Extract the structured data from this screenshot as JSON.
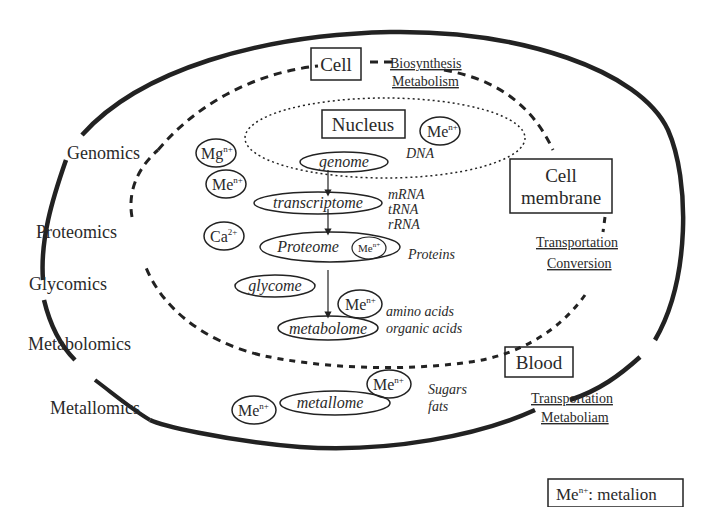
{
  "diagram": {
    "title_box": {
      "cell": "Cell"
    },
    "cell_functions": [
      "Biosynthesis",
      "Metabolism"
    ],
    "nucleus": {
      "label": "Nucleus",
      "ion": {
        "base": "Me",
        "sup": "n+"
      },
      "molecule": "DNA"
    },
    "omics_labels": [
      "Genomics",
      "Proteomics",
      "Glycomics",
      "Metabolomics",
      "Metallomics"
    ],
    "ions": {
      "mg": {
        "base": "Mg",
        "sup": "n+"
      },
      "me1": {
        "base": "Me",
        "sup": "n+"
      },
      "ca": {
        "base": "Ca",
        "sup": "2+"
      },
      "me_proteome": {
        "base": "Me",
        "sup": "n+"
      },
      "me_metabolome": {
        "base": "Me",
        "sup": "n+"
      },
      "me_metallome_left": {
        "base": "Me",
        "sup": "n+"
      },
      "me_metallome_right": {
        "base": "Me",
        "sup": "n+"
      }
    },
    "nodes": {
      "genome": "genome",
      "transcriptome": "transcriptome",
      "proteome": "Proteome",
      "glycome": "glycome",
      "metabolome": "metabolome",
      "metallome": "metallome"
    },
    "molecules": {
      "rna": [
        "mRNA",
        "tRNA",
        "rRNA"
      ],
      "proteins": "Proteins",
      "acids": [
        "amino acids",
        "organic acids"
      ],
      "sugars_fats": [
        "Sugars",
        "fats"
      ]
    },
    "cell_membrane": {
      "label_lines": [
        "Cell",
        "membrane"
      ],
      "functions": [
        "Transportation",
        "Conversion"
      ]
    },
    "blood": {
      "label": "Blood",
      "functions": [
        "Transportation",
        "Metaboliam"
      ]
    },
    "legend": {
      "base": "Me",
      "sup": "n+",
      "text": ": metalion"
    }
  }
}
